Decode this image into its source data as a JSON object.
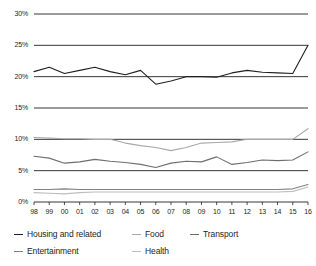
{
  "chart_data": {
    "type": "line",
    "title": "",
    "subtitle": "",
    "xlabel": "",
    "ylabel": "",
    "grid": true,
    "legend_position": "bottom-left",
    "xlim": [
      1998,
      2016
    ],
    "ylim": [
      0,
      30
    ],
    "y_ticks": [
      0,
      5,
      10,
      15,
      20,
      25,
      30
    ],
    "y_tick_labels": [
      "0%",
      "5%",
      "10%",
      "15%",
      "20%",
      "25%",
      "30%"
    ],
    "x": [
      1998,
      1999,
      2000,
      2001,
      2002,
      2003,
      2004,
      2005,
      2006,
      2007,
      2008,
      2009,
      2010,
      2011,
      2012,
      2013,
      2014,
      2015,
      2016
    ],
    "x_tick_labels": [
      "98",
      "99",
      "00",
      "01",
      "02",
      "03",
      "04",
      "05",
      "06",
      "07",
      "08",
      "09",
      "10",
      "11",
      "12",
      "13",
      "14",
      "15",
      "16"
    ],
    "series": [
      {
        "name": "Housing and related",
        "color": "#231f20",
        "values": [
          20.8,
          21.5,
          20.5,
          21.0,
          21.5,
          20.8,
          20.3,
          21.0,
          18.8,
          19.3,
          20.0,
          20.0,
          19.9,
          20.6,
          21.0,
          20.7,
          20.6,
          20.5,
          25.0
        ]
      },
      {
        "name": "Food",
        "color": "#a7a9ac",
        "values": [
          10.3,
          10.2,
          10.1,
          10.1,
          10.0,
          10.0,
          9.4,
          9.0,
          8.7,
          8.2,
          8.7,
          9.4,
          9.5,
          9.6,
          10.0,
          10.0,
          10.0,
          10.0,
          11.7
        ]
      },
      {
        "name": "Transport",
        "color": "#6d6e71",
        "values": [
          7.3,
          7.0,
          6.2,
          6.4,
          6.8,
          6.5,
          6.3,
          6.0,
          5.5,
          6.2,
          6.5,
          6.4,
          7.2,
          6.0,
          6.3,
          6.7,
          6.6,
          6.7,
          8.0
        ]
      },
      {
        "name": "Entertainment",
        "color": "#808285",
        "values": [
          2.0,
          2.0,
          2.1,
          2.0,
          2.0,
          2.0,
          2.0,
          2.0,
          2.0,
          2.0,
          2.0,
          2.0,
          2.0,
          2.0,
          2.0,
          2.0,
          2.0,
          2.1,
          2.8
        ]
      },
      {
        "name": "Health",
        "color": "#bcbec0",
        "values": [
          1.5,
          1.4,
          1.3,
          1.5,
          1.6,
          1.6,
          1.6,
          1.6,
          1.6,
          1.6,
          1.6,
          1.6,
          1.6,
          1.6,
          1.6,
          1.6,
          1.6,
          1.7,
          2.4
        ]
      }
    ]
  },
  "legend": {
    "rows": [
      [
        {
          "label": "Housing and related",
          "color": "#231f20",
          "width": 118
        },
        {
          "label": "Food",
          "color": "#a7a9ac",
          "width": 58
        },
        {
          "label": "Transport",
          "color": "#6d6e71",
          "width": 70
        }
      ],
      [
        {
          "label": "Entertainment",
          "color": "#808285",
          "width": 118
        },
        {
          "label": "Health",
          "color": "#bcbec0",
          "width": 58
        }
      ]
    ]
  }
}
